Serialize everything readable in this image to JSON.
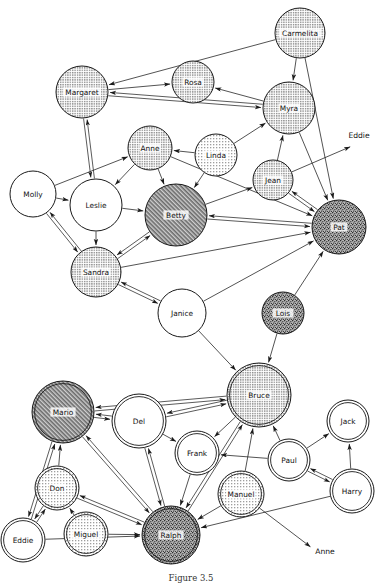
{
  "figure": {
    "caption": "Figure 3.5",
    "background_color": "#ffffff",
    "stroke_color": "#1a1a1a"
  },
  "legend_fills": {
    "white": "#ffffff",
    "light_dot": "#d9d9d9",
    "medium_dot": "#c9c9c9",
    "dark_hatch": "#9a9a9a",
    "dark_speckle": "#7d7d7d"
  },
  "graph": {
    "type": "directed-network",
    "node_count": 27,
    "external_label_count": 2,
    "nodes": [
      {
        "id": "Carmelita",
        "label": "Carmelita",
        "x": 300,
        "y": 33,
        "r": 25,
        "fill": "medium_dot",
        "ring": "single"
      },
      {
        "id": "Margaret",
        "label": "Margaret",
        "x": 82,
        "y": 92,
        "r": 26,
        "fill": "medium_dot",
        "ring": "single"
      },
      {
        "id": "Rosa",
        "label": "Rosa",
        "x": 193,
        "y": 82,
        "r": 21,
        "fill": "medium_dot",
        "ring": "single"
      },
      {
        "id": "Myra",
        "label": "Myra",
        "x": 289,
        "y": 108,
        "r": 26,
        "fill": "medium_dot",
        "ring": "single"
      },
      {
        "id": "Anne",
        "label": "Anne",
        "x": 150,
        "y": 148,
        "r": 22,
        "fill": "medium_dot",
        "ring": "single"
      },
      {
        "id": "Linda",
        "label": "Linda",
        "x": 216,
        "y": 155,
        "r": 21,
        "fill": "light_dot",
        "ring": "single"
      },
      {
        "id": "Jean",
        "label": "Jean",
        "x": 273,
        "y": 180,
        "r": 20,
        "fill": "medium_dot",
        "ring": "single"
      },
      {
        "id": "Molly",
        "label": "Molly",
        "x": 33,
        "y": 194,
        "r": 23,
        "fill": "white",
        "ring": "single"
      },
      {
        "id": "Leslie",
        "label": "Leslie",
        "x": 96,
        "y": 205,
        "r": 26,
        "fill": "white",
        "ring": "single"
      },
      {
        "id": "Betty",
        "label": "Betty",
        "x": 176,
        "y": 215,
        "r": 31,
        "fill": "dark_hatch",
        "ring": "single"
      },
      {
        "id": "Pat",
        "label": "Pat",
        "x": 339,
        "y": 227,
        "r": 27,
        "fill": "dark_speckle",
        "ring": "single"
      },
      {
        "id": "Sandra",
        "label": "Sandra",
        "x": 96,
        "y": 272,
        "r": 25,
        "fill": "medium_dot",
        "ring": "single"
      },
      {
        "id": "Janice",
        "label": "Janice",
        "x": 182,
        "y": 313,
        "r": 24,
        "fill": "white",
        "ring": "single"
      },
      {
        "id": "Lois",
        "label": "Lois",
        "x": 283,
        "y": 313,
        "r": 21,
        "fill": "dark_speckle",
        "ring": "single"
      },
      {
        "id": "Bruce",
        "label": "Bruce",
        "x": 259,
        "y": 395,
        "r": 32,
        "fill": "medium_dot",
        "ring": "double"
      },
      {
        "id": "Mario",
        "label": "Mario",
        "x": 63,
        "y": 412,
        "r": 31,
        "fill": "dark_hatch",
        "ring": "double"
      },
      {
        "id": "Del",
        "label": "Del",
        "x": 139,
        "y": 421,
        "r": 27,
        "fill": "white",
        "ring": "double"
      },
      {
        "id": "Jack",
        "label": "Jack",
        "x": 348,
        "y": 421,
        "r": 21,
        "fill": "white",
        "ring": "double"
      },
      {
        "id": "Frank",
        "label": "Frank",
        "x": 197,
        "y": 453,
        "r": 22,
        "fill": "white",
        "ring": "double"
      },
      {
        "id": "Paul",
        "label": "Paul",
        "x": 289,
        "y": 460,
        "r": 21,
        "fill": "white",
        "ring": "double"
      },
      {
        "id": "Don",
        "label": "Don",
        "x": 57,
        "y": 488,
        "r": 22,
        "fill": "light_dot",
        "ring": "double"
      },
      {
        "id": "Manuel",
        "label": "Manuel",
        "x": 241,
        "y": 494,
        "r": 23,
        "fill": "light_dot",
        "ring": "double"
      },
      {
        "id": "Harry",
        "label": "Harry",
        "x": 352,
        "y": 491,
        "r": 22,
        "fill": "white",
        "ring": "double"
      },
      {
        "id": "Miguel",
        "label": "Miguel",
        "x": 86,
        "y": 534,
        "r": 22,
        "fill": "light_dot",
        "ring": "double"
      },
      {
        "id": "Ralph",
        "label": "Ralph",
        "x": 171,
        "y": 535,
        "r": 29,
        "fill": "dark_speckle",
        "ring": "double"
      },
      {
        "id": "Eddie",
        "label": "Eddie",
        "x": 23,
        "y": 540,
        "r": 22,
        "fill": "white",
        "ring": "double"
      }
    ],
    "external_labels": [
      {
        "id": "ext-eddie",
        "label": "Eddie",
        "x": 359,
        "y": 135,
        "tip_x": 352,
        "tip_y": 146,
        "from": "Jean"
      },
      {
        "id": "ext-anne",
        "label": "Anne",
        "x": 325,
        "y": 551,
        "tip_x": 312,
        "tip_y": 548,
        "from": "Manuel"
      }
    ],
    "edges": [
      {
        "from": "Carmelita",
        "to": "Margaret",
        "arrow": "single"
      },
      {
        "from": "Carmelita",
        "to": "Myra",
        "arrow": "single"
      },
      {
        "from": "Carmelita",
        "to": "Pat",
        "arrow": "single"
      },
      {
        "from": "Margaret",
        "to": "Rosa",
        "arrow": "single"
      },
      {
        "from": "Margaret",
        "to": "Myra",
        "arrow": "mutual"
      },
      {
        "from": "Margaret",
        "to": "Leslie",
        "arrow": "mutual"
      },
      {
        "from": "Myra",
        "to": "Rosa",
        "arrow": "single"
      },
      {
        "from": "Myra",
        "to": "Pat",
        "arrow": "single"
      },
      {
        "from": "Linda",
        "to": "Anne",
        "arrow": "single"
      },
      {
        "from": "Linda",
        "to": "Myra",
        "arrow": "single"
      },
      {
        "from": "Linda",
        "to": "Betty",
        "arrow": "single"
      },
      {
        "from": "Jean",
        "to": "Myra",
        "arrow": "single"
      },
      {
        "from": "Jean",
        "to": "Pat",
        "arrow": "mutual"
      },
      {
        "from": "Jean",
        "to": "ext-eddie",
        "arrow": "single"
      },
      {
        "from": "Anne",
        "to": "Leslie",
        "arrow": "single"
      },
      {
        "from": "Anne",
        "to": "Betty",
        "arrow": "single"
      },
      {
        "from": "Anne",
        "to": "Pat",
        "arrow": "single"
      },
      {
        "from": "Molly",
        "to": "Anne",
        "arrow": "single"
      },
      {
        "from": "Molly",
        "to": "Leslie",
        "arrow": "single"
      },
      {
        "from": "Molly",
        "to": "Sandra",
        "arrow": "mutual"
      },
      {
        "from": "Leslie",
        "to": "Betty",
        "arrow": "single"
      },
      {
        "from": "Leslie",
        "to": "Sandra",
        "arrow": "single"
      },
      {
        "from": "Betty",
        "to": "Jean",
        "arrow": "single"
      },
      {
        "from": "Betty",
        "to": "Pat",
        "arrow": "mutual"
      },
      {
        "from": "Betty",
        "to": "Sandra",
        "arrow": "mutual"
      },
      {
        "from": "Sandra",
        "to": "Janice",
        "arrow": "mutual"
      },
      {
        "from": "Sandra",
        "to": "Pat",
        "arrow": "single"
      },
      {
        "from": "Janice",
        "to": "Pat",
        "arrow": "single"
      },
      {
        "from": "Janice",
        "to": "Bruce",
        "arrow": "single"
      },
      {
        "from": "Lois",
        "to": "Pat",
        "arrow": "single"
      },
      {
        "from": "Lois",
        "to": "Bruce",
        "arrow": "single"
      },
      {
        "from": "Bruce",
        "to": "Mario",
        "arrow": "mutual"
      },
      {
        "from": "Bruce",
        "to": "Del",
        "arrow": "mutual"
      },
      {
        "from": "Bruce",
        "to": "Frank",
        "arrow": "single"
      },
      {
        "from": "Bruce",
        "to": "Ralph",
        "arrow": "mutual"
      },
      {
        "from": "Mario",
        "to": "Del",
        "arrow": "mutual"
      },
      {
        "from": "Mario",
        "to": "Ralph",
        "arrow": "mutual"
      },
      {
        "from": "Mario",
        "to": "Eddie",
        "arrow": "mutual"
      },
      {
        "from": "Del",
        "to": "Frank",
        "arrow": "single"
      },
      {
        "from": "Del",
        "to": "Ralph",
        "arrow": "mutual"
      },
      {
        "from": "Frank",
        "to": "Ralph",
        "arrow": "single"
      },
      {
        "from": "Paul",
        "to": "Frank",
        "arrow": "single"
      },
      {
        "from": "Paul",
        "to": "Jack",
        "arrow": "single"
      },
      {
        "from": "Paul",
        "to": "Bruce",
        "arrow": "single"
      },
      {
        "from": "Paul",
        "to": "Harry",
        "arrow": "mutual"
      },
      {
        "from": "Harry",
        "to": "Jack",
        "arrow": "single"
      },
      {
        "from": "Harry",
        "to": "Ralph",
        "arrow": "single"
      },
      {
        "from": "Manuel",
        "to": "Bruce",
        "arrow": "single"
      },
      {
        "from": "Manuel",
        "to": "Ralph",
        "arrow": "single"
      },
      {
        "from": "Manuel",
        "to": "ext-anne",
        "arrow": "single"
      },
      {
        "from": "Don",
        "to": "Mario",
        "arrow": "single"
      },
      {
        "from": "Don",
        "to": "Ralph",
        "arrow": "mutual"
      },
      {
        "from": "Miguel",
        "to": "Don",
        "arrow": "single"
      },
      {
        "from": "Miguel",
        "to": "Ralph",
        "arrow": "single"
      },
      {
        "from": "Eddie",
        "to": "Don",
        "arrow": "mutual"
      },
      {
        "from": "Eddie",
        "to": "Ralph",
        "arrow": "single"
      }
    ]
  }
}
